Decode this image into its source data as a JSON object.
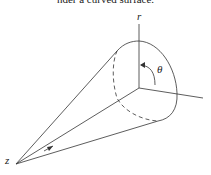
{
  "caption": "nder a curved surface.",
  "figure": {
    "labels": {
      "r_axis": "r",
      "angle": "θ",
      "apex": "z"
    },
    "stroke_color": "#333333"
  }
}
